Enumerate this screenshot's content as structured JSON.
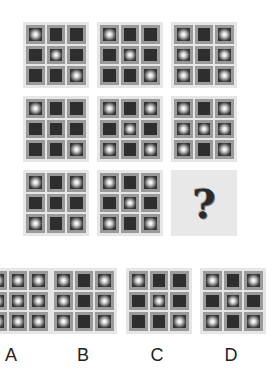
{
  "puzzle": {
    "matrix": [
      {
        "id": "r1c1",
        "filled": [
          1,
          0,
          0,
          0,
          1,
          0,
          0,
          0,
          1
        ]
      },
      {
        "id": "r1c2",
        "filled": [
          1,
          0,
          0,
          0,
          1,
          0,
          0,
          0,
          1
        ]
      },
      {
        "id": "r1c3",
        "filled": [
          1,
          0,
          1,
          1,
          0,
          1,
          1,
          0,
          1
        ]
      },
      {
        "id": "r2c1",
        "filled": [
          1,
          0,
          0,
          0,
          0,
          0,
          0,
          0,
          1
        ]
      },
      {
        "id": "r2c2",
        "filled": [
          1,
          0,
          1,
          0,
          1,
          0,
          1,
          0,
          1
        ]
      },
      {
        "id": "r2c3",
        "filled": [
          1,
          0,
          1,
          1,
          1,
          1,
          1,
          0,
          1
        ]
      },
      {
        "id": "r3c1",
        "filled": [
          1,
          0,
          1,
          0,
          0,
          0,
          1,
          0,
          1
        ]
      },
      {
        "id": "r3c2",
        "filled": [
          1,
          0,
          1,
          0,
          1,
          0,
          1,
          0,
          1
        ]
      }
    ],
    "missing": {
      "symbol": "?"
    },
    "options": [
      {
        "label": "A",
        "filled": [
          1,
          1,
          1,
          1,
          1,
          1,
          1,
          1,
          1
        ]
      },
      {
        "label": "B",
        "filled": [
          1,
          0,
          1,
          1,
          0,
          1,
          1,
          0,
          1
        ]
      },
      {
        "label": "C",
        "filled": [
          1,
          0,
          0,
          0,
          1,
          0,
          0,
          0,
          1
        ]
      },
      {
        "label": "D",
        "filled": [
          1,
          0,
          1,
          0,
          1,
          0,
          1,
          0,
          1
        ]
      }
    ]
  },
  "colors": {
    "frame": "#e6e6e6",
    "cell_border": "#9a9a9a",
    "cell_dark": "#2e2e2e",
    "dot_highlight": "#ffffff"
  }
}
